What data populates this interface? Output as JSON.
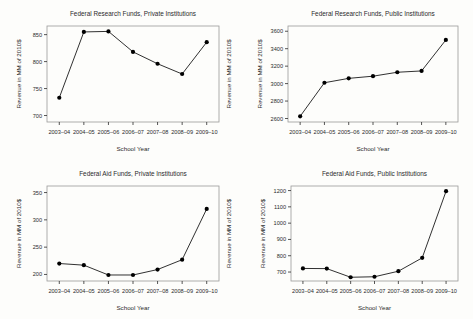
{
  "figure": {
    "background": "#fdfdfb",
    "line_color": "#1a1a1a",
    "marker_color": "#000000",
    "axis_color": "#2b2b2b",
    "frame_color": "#9a9a9a",
    "panel_count": 4,
    "layout": "2x2"
  },
  "shared": {
    "xlabel": "School Year",
    "ylabel": "Revenue in MM of 2010$",
    "categories": [
      "2003–04",
      "2004–05",
      "2005–06",
      "2006–07",
      "2007–08",
      "2008–09",
      "2009–10"
    ]
  },
  "chart_data": [
    {
      "id": "federal-research-private",
      "type": "line",
      "title": "Federal Research Funds, Private Institutions",
      "xlabel": "School Year",
      "ylabel": "Revenue in MM of 2010$",
      "categories": [
        "2003–04",
        "2004–05",
        "2005–06",
        "2006–07",
        "2007–08",
        "2008–09",
        "2009–10"
      ],
      "values": [
        733,
        855,
        856,
        818,
        796,
        777,
        836
      ],
      "yticks": [
        700,
        750,
        800,
        850
      ],
      "ylim": [
        688,
        866
      ],
      "grid": false,
      "legend": false,
      "y_axis_right_duplicate_label": "Revenue in MM of 2010$"
    },
    {
      "id": "federal-research-public",
      "type": "line",
      "title": "Federal Research Funds, Public Institutions",
      "xlabel": "School Year",
      "ylabel": "Revenue in MM of 2010$",
      "categories": [
        "2003–04",
        "2004–05",
        "2005–06",
        "2006–07",
        "2007–08",
        "2008–09",
        "2009–10"
      ],
      "values": [
        2625,
        3010,
        3060,
        3085,
        3130,
        3145,
        3500
      ],
      "yticks": [
        2600,
        2800,
        3000,
        3200,
        3400,
        3600
      ],
      "ylim": [
        2560,
        3660
      ],
      "grid": false,
      "legend": false
    },
    {
      "id": "federal-aid-private",
      "type": "line",
      "title": "Federal Aid Funds, Private Institutions",
      "xlabel": "School Year",
      "ylabel": "Revenue in MM of 2010$",
      "categories": [
        "2003–04",
        "2004–05",
        "2005–06",
        "2006–07",
        "2007–08",
        "2008–09",
        "2009–10"
      ],
      "values": [
        220,
        217,
        199,
        199,
        209,
        227,
        320
      ],
      "yticks": [
        200,
        250,
        300,
        350
      ],
      "ylim": [
        188,
        362
      ],
      "grid": false,
      "legend": false,
      "y_axis_right_duplicate_label": "Revenue in MM of 2010$"
    },
    {
      "id": "federal-aid-public",
      "type": "line",
      "title": "Federal Aid Funds, Public Institutions",
      "xlabel": "School Year",
      "ylabel": "Revenue in MM of 2010$",
      "categories": [
        "2003–04",
        "2004–05",
        "2005–06",
        "2006–07",
        "2007–08",
        "2008–09",
        "2009–10"
      ],
      "values": [
        722,
        721,
        668,
        671,
        705,
        787,
        1196
      ],
      "yticks": [
        700,
        800,
        900,
        1000,
        1100,
        1200
      ],
      "ylim": [
        645,
        1228
      ],
      "grid": false,
      "legend": false
    }
  ]
}
